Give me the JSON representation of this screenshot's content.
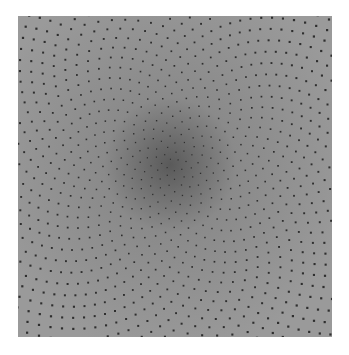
{
  "image": {
    "description": "Grayscale square halftone-like dot pattern arranged in spiral (phyllotaxis) rows, denser toward the center",
    "background_color": "#ffffff",
    "panel_color": "#9a9a9a",
    "dot_color": "#2e2e2e",
    "center_shade_color": "#5a5a5a"
  }
}
